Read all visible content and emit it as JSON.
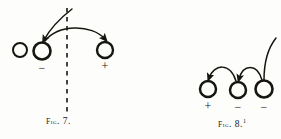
{
  "plate": {
    "background_color": "#fdfdfb",
    "ink_color": "#17150f",
    "figures": [
      {
        "id": "fig-7",
        "caption_prefix": "Fig",
        "caption_dot": ".",
        "caption_number": "7.",
        "caption_full": "Fig. 7.",
        "footnote_marker": "",
        "guide_line": {
          "type": "dashed-vertical",
          "x": 67,
          "y_top": 8,
          "y_bottom": 112
        },
        "nodes": [
          {
            "name": "circle-plain",
            "label": "",
            "cx": 20,
            "cy": 50,
            "r": 7,
            "stroke_width": 2.0
          },
          {
            "name": "circle-negative",
            "label": "−",
            "cx": 42,
            "cy": 51,
            "r": 8.5,
            "stroke_width": 2.6
          },
          {
            "name": "circle-positive",
            "label": "+",
            "cx": 105,
            "cy": 50,
            "r": 8,
            "stroke_width": 2.4
          }
        ],
        "arrows": [
          {
            "name": "arc-tall-return",
            "from": "above-right",
            "to": "circle-negative",
            "direction": "down-left"
          },
          {
            "name": "arc-flat-transfer",
            "from": "circle-negative",
            "to": "circle-positive",
            "direction": "down-right"
          }
        ]
      },
      {
        "id": "fig-8",
        "caption_prefix": "Fig",
        "caption_dot": ".",
        "caption_number": "8.",
        "caption_full": "Fig. 8.",
        "footnote_marker": "1",
        "guide_line": null,
        "nodes": [
          {
            "name": "circle-positive",
            "label": "+",
            "cx": 208,
            "cy": 89,
            "r": 8,
            "stroke_width": 2.5
          },
          {
            "name": "circle-negative-1",
            "label": "−",
            "cx": 238,
            "cy": 90,
            "r": 8,
            "stroke_width": 2.5
          },
          {
            "name": "circle-negative-2",
            "label": "−",
            "cx": 264,
            "cy": 89,
            "r": 8.5,
            "stroke_width": 2.6
          }
        ],
        "arrows": [
          {
            "name": "arc-hop-left",
            "from": "circle-negative-1",
            "to": "circle-positive",
            "direction": "down-left"
          },
          {
            "name": "arc-hop-middle",
            "from": "circle-negative-2",
            "to": "circle-negative-1",
            "direction": "down-left"
          },
          {
            "name": "curve-tail-up",
            "from": "circle-negative-2",
            "to": "upper-right",
            "direction": "up-right"
          }
        ]
      }
    ]
  }
}
